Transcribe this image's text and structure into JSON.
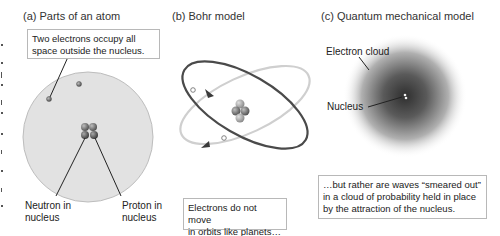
{
  "panels": [
    {
      "id": "a",
      "title": "(a)  Parts of an atom",
      "callout": [
        "Two electrons occupy all",
        "space outside the nucleus."
      ],
      "labels": {
        "neutron": [
          "Neutron in",
          "nucleus"
        ],
        "proton": [
          "Proton in",
          "nucleus"
        ]
      }
    },
    {
      "id": "b",
      "title": "(b)  Bohr model",
      "callout": [
        "Electrons do not move",
        "in orbits like planets…"
      ]
    },
    {
      "id": "c",
      "title": "(c)  Quantum mechanical model",
      "labels": {
        "electron_cloud": "Electron cloud",
        "nucleus": "Nucleus"
      },
      "callout": [
        "…but rather are waves “smeared out”",
        "in a cloud of probability held in place",
        "by the attraction of the nucleus."
      ]
    }
  ],
  "colors": {
    "atom_fill": "#e2e2e2",
    "atom_edge": "#bdbdbd",
    "particle": "#7a7a7a",
    "orbit_dark": "#4a4a4a",
    "orbit_light": "#c8c8c8",
    "cloud_core": "#3c3c3c"
  }
}
